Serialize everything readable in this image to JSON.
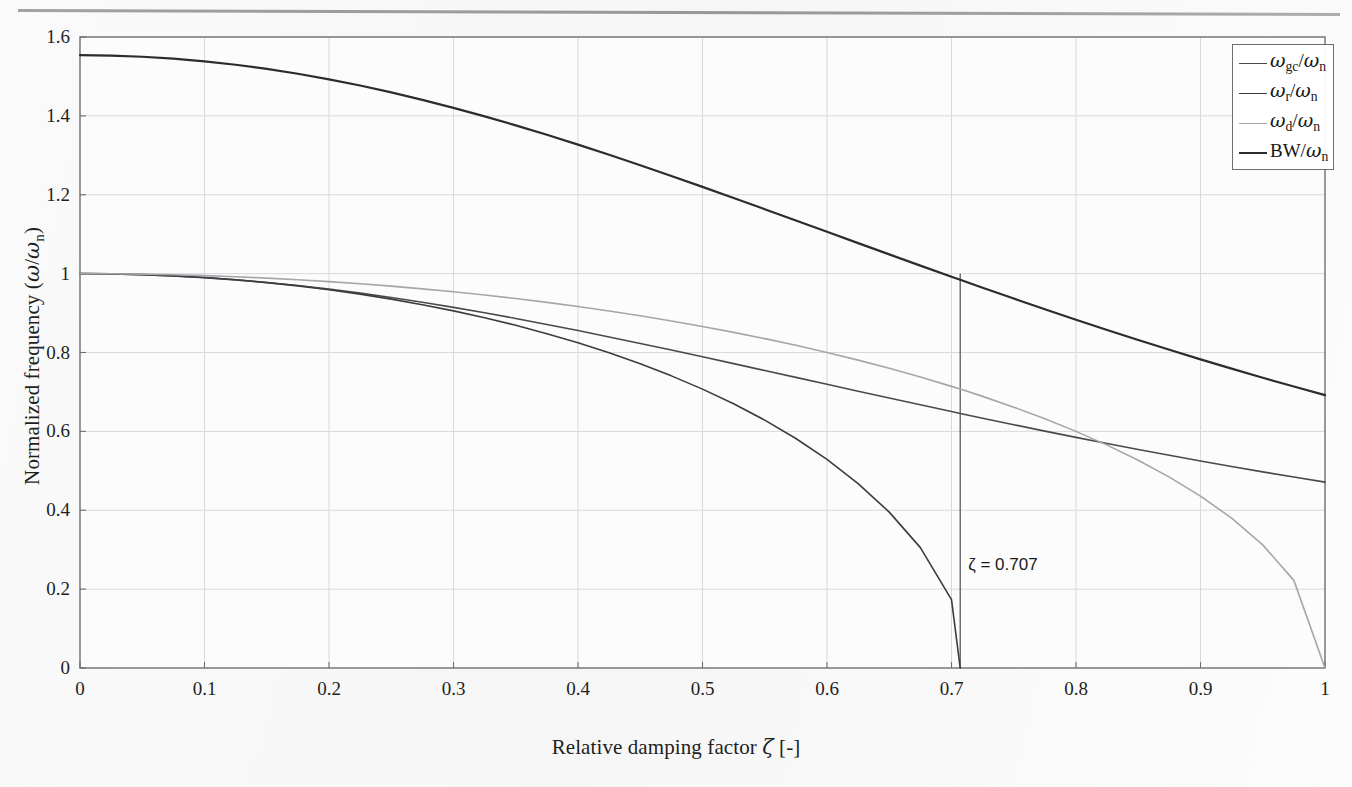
{
  "figure": {
    "background_color": "#fafafa",
    "axes_color": "#6e6e72",
    "grid_color": "#d9d9dd",
    "page_rule_visible": true
  },
  "chart_data": {
    "type": "line",
    "title": "",
    "xlabel": "Relative damping factor ζ [-]",
    "ylabel": "Normalized frequency (ω/ωn)",
    "xlim": [
      0,
      1
    ],
    "ylim": [
      0,
      1.6
    ],
    "xticks": [
      0,
      0.1,
      0.2,
      0.3,
      0.4,
      0.5,
      0.6,
      0.7,
      0.8,
      0.9,
      1
    ],
    "yticks": [
      0,
      0.2,
      0.4,
      0.6,
      0.8,
      1,
      1.2,
      1.4,
      1.6
    ],
    "xtick_labels": [
      "0",
      "0.1",
      "0.2",
      "0.3",
      "0.4",
      "0.5",
      "0.6",
      "0.7",
      "0.8",
      "0.9",
      "1"
    ],
    "ytick_labels": [
      "0",
      "0.2",
      "0.4",
      "0.6",
      "0.8",
      "1",
      "1.2",
      "1.4",
      "1.6"
    ],
    "grid": true,
    "legend_position": "top-right",
    "x": [
      0,
      0.025,
      0.05,
      0.075,
      0.1,
      0.125,
      0.15,
      0.175,
      0.2,
      0.225,
      0.25,
      0.275,
      0.3,
      0.325,
      0.35,
      0.375,
      0.4,
      0.425,
      0.45,
      0.475,
      0.5,
      0.525,
      0.55,
      0.575,
      0.6,
      0.625,
      0.65,
      0.675,
      0.7,
      0.707,
      0.725,
      0.75,
      0.775,
      0.8,
      0.825,
      0.85,
      0.875,
      0.9,
      0.925,
      0.95,
      0.975,
      1
    ],
    "series": [
      {
        "name": "ωgc/ωn",
        "legend_label": "ωgc/ωn",
        "color": "#4a4a4e",
        "width": 1.6,
        "values": [
          1,
          0.9994,
          0.9975,
          0.9944,
          0.99,
          0.9844,
          0.9776,
          0.9697,
          0.9606,
          0.9505,
          0.9394,
          0.9273,
          0.9144,
          0.9007,
          0.8863,
          0.8712,
          0.8556,
          0.8395,
          0.823,
          0.8062,
          0.7891,
          0.7718,
          0.7544,
          0.7369,
          0.7194,
          0.7019,
          0.6845,
          0.6673,
          0.6502,
          0.6454,
          0.6334,
          0.6169,
          0.6007,
          0.5848,
          0.5693,
          0.5541,
          0.5393,
          0.5249,
          0.5109,
          0.4973,
          0.4841,
          0.4713
        ]
      },
      {
        "name": "ωr/ωn",
        "legend_label": "ωr/ωn",
        "color": "#3c3c40",
        "width": 1.6,
        "formula": "sqrt(1 - 2*zeta^2)",
        "values": [
          1,
          0.99937,
          0.99749,
          0.99435,
          0.98995,
          0.98425,
          0.97725,
          0.9689,
          0.9592,
          0.94809,
          0.93541,
          0.92128,
          0.90554,
          0.88811,
          0.86891,
          0.84779,
          0.82462,
          0.79922,
          0.77136,
          0.74075,
          0.70711,
          0.66992,
          0.62849,
          0.58184,
          0.52915,
          0.46771,
          0.39528,
          0.30516,
          0.17321,
          0.0,
          null,
          null,
          null,
          null,
          null,
          null,
          null,
          null,
          null,
          null,
          null,
          null
        ]
      },
      {
        "name": "ωd/ωn",
        "legend_label": "ωd/ωn",
        "color": "#a6a6aa",
        "width": 1.6,
        "formula": "sqrt(1 - zeta^2)",
        "values": [
          1,
          0.99969,
          0.99875,
          0.99718,
          0.99499,
          0.99216,
          0.98869,
          0.98457,
          0.9798,
          0.97436,
          0.96825,
          0.96145,
          0.95394,
          0.94571,
          0.93675,
          0.92702,
          0.9165,
          0.90517,
          0.89303,
          0.87999,
          0.86603,
          0.8511,
          0.83516,
          0.81815,
          0.8,
          0.78062,
          0.75993,
          0.73782,
          0.71414,
          0.70721,
          0.68875,
          0.66144,
          0.63197,
          0.6,
          0.56512,
          0.52678,
          0.48412,
          0.43589,
          0.38,
          0.31225,
          0.2222,
          0.0
        ]
      },
      {
        "name": "BW/ωn",
        "legend_label": "BW/ωn",
        "color": "#2c2c30",
        "width": 2.2,
        "formula": "sqrt(1 - 2*zeta^2 + sqrt(4*zeta^4 - 4*zeta^2 + 2))",
        "values": [
          1.5538,
          1.5528,
          1.5499,
          1.5451,
          1.5383,
          1.5296,
          1.5191,
          1.5068,
          1.4927,
          1.477,
          1.4596,
          1.4407,
          1.4204,
          1.3988,
          1.376,
          1.3521,
          1.3271,
          1.3014,
          1.2748,
          1.2476,
          1.2199,
          1.1918,
          1.1634,
          1.1348,
          1.1061,
          1.0774,
          1.0488,
          1.0203,
          0.9921,
          0.9843,
          0.9643,
          0.9368,
          0.9098,
          0.8832,
          0.8572,
          0.8317,
          0.8068,
          0.7826,
          0.759,
          0.736,
          0.7137,
          0.692
        ]
      }
    ],
    "annotations": [
      {
        "name": "zeta-marker",
        "text": "ζ = 0.707",
        "x": 0.707,
        "y": 0.26,
        "line": {
          "from_y": 0.0,
          "to_y": 1.0,
          "color": "#5a5a5e"
        }
      }
    ]
  },
  "legend": {
    "entries": [
      {
        "label_main": "ω",
        "label_sub": "gc",
        "label_tail": "/ω",
        "label_tail_sub": "n"
      },
      {
        "label_main": "ω",
        "label_sub": "r",
        "label_tail": "/ω",
        "label_tail_sub": "n"
      },
      {
        "label_main": "ω",
        "label_sub": "d",
        "label_tail": "/ω",
        "label_tail_sub": "n"
      },
      {
        "label_main": "BW",
        "label_sub": "",
        "label_tail": "/ω",
        "label_tail_sub": "n"
      }
    ]
  },
  "ylabel_parts": {
    "prefix": "Normalized frequency (",
    "omega": "ω",
    "slash": "/",
    "omega2": "ω",
    "sub": "n",
    "suffix": ")"
  },
  "xlabel_parts": {
    "prefix": "Relative damping factor ",
    "zeta": "ζ",
    "suffix": " [-]"
  }
}
